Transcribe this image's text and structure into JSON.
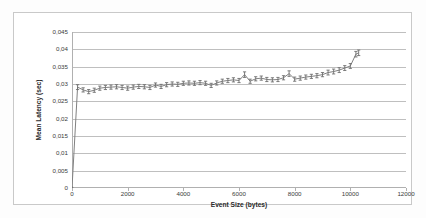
{
  "chart_data": {
    "type": "line",
    "title": "",
    "xlabel": "Event Size (bytes)",
    "ylabel": "Mean Latency (sec)",
    "xlim": [
      0,
      12000
    ],
    "ylim": [
      0,
      0.045
    ],
    "grid": "horizontal",
    "legend": "none",
    "markers": "error-bar",
    "line_color": "#808080",
    "marker_color": "#6e6e6e",
    "gridline_color": "#bfbfbf",
    "decimal_separator": ",",
    "xticks": [
      0,
      2000,
      4000,
      6000,
      8000,
      10000,
      12000
    ],
    "xtick_labels": [
      "0",
      "2000",
      "4000",
      "6000",
      "8000",
      "10000",
      "12000"
    ],
    "yticks": [
      0,
      0.005,
      0.01,
      0.015,
      0.02,
      0.025,
      0.03,
      0.035,
      0.04,
      0.045
    ],
    "ytick_labels": [
      "0",
      "0,005",
      "0,01",
      "0,015",
      "0,02",
      "0,025",
      "0,03",
      "0,035",
      "0,04",
      "0,045"
    ],
    "x": [
      0,
      200,
      400,
      600,
      800,
      1000,
      1200,
      1400,
      1600,
      1800,
      2000,
      2200,
      2400,
      2600,
      2800,
      3000,
      3200,
      3400,
      3600,
      3800,
      4000,
      4200,
      4400,
      4600,
      4800,
      5000,
      5200,
      5400,
      5600,
      5800,
      6000,
      6200,
      6400,
      6600,
      6800,
      7000,
      7200,
      7400,
      7600,
      7800,
      8000,
      8200,
      8400,
      8600,
      8800,
      9000,
      9200,
      9400,
      9600,
      9800,
      10000,
      10200,
      10300
    ],
    "y": [
      0,
      0.0291,
      0.0283,
      0.0278,
      0.0282,
      0.0288,
      0.029,
      0.0291,
      0.0292,
      0.029,
      0.0288,
      0.0291,
      0.0293,
      0.0292,
      0.029,
      0.0297,
      0.0293,
      0.0298,
      0.03,
      0.0299,
      0.0302,
      0.0303,
      0.0302,
      0.0304,
      0.0302,
      0.0296,
      0.0303,
      0.0308,
      0.031,
      0.0312,
      0.031,
      0.0327,
      0.0308,
      0.0315,
      0.0317,
      0.0313,
      0.0312,
      0.0313,
      0.0318,
      0.033,
      0.0314,
      0.0317,
      0.032,
      0.0322,
      0.0324,
      0.0327,
      0.0333,
      0.0336,
      0.034,
      0.0346,
      0.0352,
      0.0386,
      0.039
    ],
    "yerr": [
      0,
      0.0007,
      0.0006,
      0.0006,
      0.0006,
      0.0006,
      0.0006,
      0.0006,
      0.0006,
      0.0006,
      0.0006,
      0.0006,
      0.0006,
      0.0006,
      0.0006,
      0.0006,
      0.0006,
      0.0006,
      0.0006,
      0.0006,
      0.0006,
      0.0006,
      0.0006,
      0.0006,
      0.0006,
      0.0006,
      0.0006,
      0.0006,
      0.0006,
      0.0006,
      0.0006,
      0.0008,
      0.0006,
      0.0006,
      0.0006,
      0.0006,
      0.0006,
      0.0006,
      0.0006,
      0.0008,
      0.0006,
      0.0006,
      0.0006,
      0.0006,
      0.0006,
      0.0006,
      0.0007,
      0.0007,
      0.0007,
      0.0007,
      0.0007,
      0.0008,
      0.0008
    ]
  }
}
